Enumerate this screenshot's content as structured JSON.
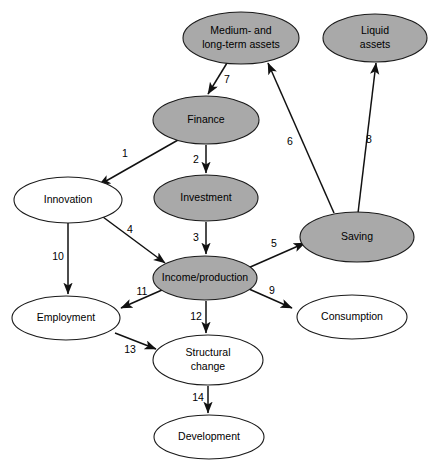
{
  "diagram": {
    "background_color": "#ffffff",
    "shaded_fill": "#a9a9a9",
    "plain_fill": "#ffffff",
    "stroke_color": "#111111",
    "nodes": [
      {
        "id": "medium_long_assets",
        "label_line1": "Medium- and",
        "label_line2": "long-term assets",
        "style": "shaded",
        "cx": 241,
        "cy": 38,
        "rx": 58,
        "ry": 26
      },
      {
        "id": "liquid_assets",
        "label_line1": "Liquid",
        "label_line2": "assets",
        "style": "shaded",
        "cx": 375,
        "cy": 38,
        "rx": 52,
        "ry": 24
      },
      {
        "id": "finance",
        "label_line1": "Finance",
        "label_line2": "",
        "style": "shaded",
        "cx": 206,
        "cy": 120,
        "rx": 53,
        "ry": 24
      },
      {
        "id": "investment",
        "label_line1": "Investment",
        "label_line2": "",
        "style": "shaded",
        "cx": 206,
        "cy": 198,
        "rx": 52,
        "ry": 23
      },
      {
        "id": "innovation",
        "label_line1": "Innovation",
        "label_line2": "",
        "style": "plain",
        "cx": 68,
        "cy": 200,
        "rx": 54,
        "ry": 23
      },
      {
        "id": "saving",
        "label_line1": "Saving",
        "label_line2": "",
        "style": "shaded",
        "cx": 357,
        "cy": 237,
        "rx": 57,
        "ry": 25
      },
      {
        "id": "income_production",
        "label_line1": "Income/production",
        "label_line2": "",
        "style": "shaded",
        "cx": 205,
        "cy": 278,
        "rx": 52,
        "ry": 22
      },
      {
        "id": "employment",
        "label_line1": "Employment",
        "label_line2": "",
        "style": "plain",
        "cx": 66,
        "cy": 318,
        "rx": 54,
        "ry": 22
      },
      {
        "id": "consumption",
        "label_line1": "Consumption",
        "label_line2": "",
        "style": "plain",
        "cx": 352,
        "cy": 317,
        "rx": 55,
        "ry": 22
      },
      {
        "id": "structural_change",
        "label_line1": "Structural",
        "label_line2": "change",
        "style": "plain",
        "cx": 208,
        "cy": 360,
        "rx": 55,
        "ry": 25
      },
      {
        "id": "development",
        "label_line1": "Development",
        "label_line2": "",
        "style": "plain",
        "cx": 209,
        "cy": 437,
        "rx": 55,
        "ry": 22
      }
    ],
    "edges": [
      {
        "id": "e1",
        "number": "1",
        "from": "finance",
        "to": "innovation",
        "x1": 178,
        "y1": 140,
        "x2": 99,
        "y2": 185,
        "lx": 125,
        "ly": 154
      },
      {
        "id": "e2",
        "number": "2",
        "from": "finance",
        "to": "investment",
        "x1": 206,
        "y1": 145,
        "x2": 206,
        "y2": 173,
        "lx": 196,
        "ly": 160
      },
      {
        "id": "e3",
        "number": "3",
        "from": "investment",
        "to": "income_production",
        "x1": 206,
        "y1": 222,
        "x2": 206,
        "y2": 254,
        "lx": 196,
        "ly": 238
      },
      {
        "id": "e4",
        "number": "4",
        "from": "innovation",
        "to": "income_production",
        "x1": 103,
        "y1": 217,
        "x2": 165,
        "y2": 263,
        "lx": 130,
        "ly": 230
      },
      {
        "id": "e5",
        "number": "5",
        "from": "income_production",
        "to": "saving",
        "x1": 248,
        "y1": 268,
        "x2": 305,
        "y2": 243,
        "lx": 274,
        "ly": 244
      },
      {
        "id": "e6",
        "number": "6",
        "from": "saving",
        "to": "medium_long_assets",
        "x1": 334,
        "y1": 213,
        "x2": 268,
        "y2": 63,
        "lx": 290,
        "ly": 142
      },
      {
        "id": "e7",
        "number": "7",
        "from": "medium_long_assets",
        "to": "finance",
        "x1": 227,
        "y1": 63,
        "x2": 208,
        "y2": 94,
        "lx": 227,
        "ly": 80
      },
      {
        "id": "e8",
        "number": "8",
        "from": "saving",
        "to": "liquid_assets",
        "x1": 358,
        "y1": 213,
        "x2": 376,
        "y2": 63,
        "lx": 369,
        "ly": 140
      },
      {
        "id": "e9",
        "number": "9",
        "from": "income_production",
        "to": "consumption",
        "x1": 249,
        "y1": 289,
        "x2": 292,
        "y2": 308,
        "lx": 272,
        "ly": 291
      },
      {
        "id": "e10",
        "number": "10",
        "from": "innovation",
        "to": "employment",
        "x1": 68,
        "y1": 223,
        "x2": 68,
        "y2": 294,
        "lx": 58,
        "ly": 257
      },
      {
        "id": "e11",
        "number": "11",
        "from": "income_production",
        "to": "employment",
        "x1": 162,
        "y1": 290,
        "x2": 121,
        "y2": 308,
        "lx": 142,
        "ly": 292
      },
      {
        "id": "e12",
        "number": "12",
        "from": "income_production",
        "to": "structural_change",
        "x1": 206,
        "y1": 301,
        "x2": 206,
        "y2": 333,
        "lx": 196,
        "ly": 317
      },
      {
        "id": "e13",
        "number": "13",
        "from": "employment",
        "to": "structural_change",
        "x1": 115,
        "y1": 333,
        "x2": 156,
        "y2": 349,
        "lx": 130,
        "ly": 350
      },
      {
        "id": "e14",
        "number": "14",
        "from": "structural_change",
        "to": "development",
        "x1": 208,
        "y1": 386,
        "x2": 208,
        "y2": 413,
        "lx": 198,
        "ly": 398
      }
    ]
  }
}
